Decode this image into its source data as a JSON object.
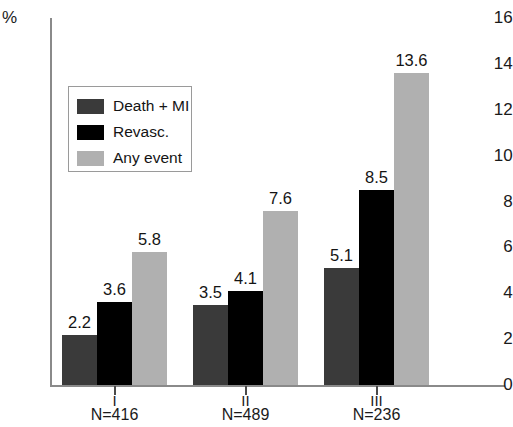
{
  "chart_data": {
    "type": "bar",
    "title": "",
    "xlabel": "",
    "ylabel": "%",
    "ylim": [
      0,
      16
    ],
    "yticks": [
      0,
      2,
      4,
      6,
      8,
      10,
      12,
      14,
      16
    ],
    "ytick_labels": [
      "0",
      "2",
      "4",
      "6",
      "8",
      "10",
      "12",
      "14",
      "16"
    ],
    "grid": false,
    "legend_position": "upper-left-inside",
    "categories": [
      "I",
      "II",
      "III"
    ],
    "category_sublabels": [
      "N=416",
      "N=489",
      "N=236"
    ],
    "series": [
      {
        "name": "Death + MI",
        "color": "#3a3a3a",
        "values": [
          2.2,
          3.5,
          5.1
        ],
        "labels": [
          "2.2",
          "3.5",
          "5.1"
        ]
      },
      {
        "name": "Revasc.",
        "color": "#000000",
        "values": [
          3.6,
          4.1,
          8.5
        ],
        "labels": [
          "3.6",
          "4.1",
          "8.5"
        ]
      },
      {
        "name": "Any event",
        "color": "#b0b0b0",
        "values": [
          5.8,
          7.6,
          13.6
        ],
        "labels": [
          "5.8",
          "7.6",
          "13.6"
        ]
      }
    ]
  },
  "axis": {
    "percent_symbol": "%",
    "top_tick": "16"
  },
  "legend": {
    "items": [
      {
        "label": "Death + MI",
        "color": "#3a3a3a"
      },
      {
        "label": "Revasc.",
        "color": "#000000"
      },
      {
        "label": "Any event",
        "color": "#b0b0b0"
      }
    ]
  }
}
